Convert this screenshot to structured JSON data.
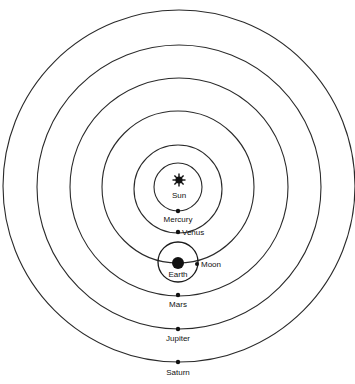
{
  "diagram": {
    "type": "geocentric-tychonic-style orbit diagram",
    "center": {
      "x": 178,
      "y": 187
    },
    "colors": {
      "background": "#ffffff",
      "ink": "#111111"
    },
    "sun": {
      "label": "Sun",
      "icon": "sun-icon",
      "x": 179,
      "y": 185
    },
    "orbits": [
      {
        "name": "Mercury",
        "label": "Mercury",
        "r": 24
      },
      {
        "name": "Venus",
        "label": "Venus",
        "r": 45
      },
      {
        "name": "Earth",
        "label": "Earth",
        "r": 76
      },
      {
        "name": "Mars",
        "label": "Mars",
        "r": 108
      },
      {
        "name": "Jupiter",
        "label": "Jupiter",
        "r": 142
      },
      {
        "name": "Saturn",
        "label": "Saturn",
        "r": 175
      }
    ],
    "labels": {
      "sun": "Sun",
      "mercury": "Mercury",
      "venus": "Venus",
      "earth": "Earth",
      "moon": "Moon",
      "mars": "Mars",
      "jupiter": "Jupiter",
      "saturn": "Saturn"
    },
    "earth_system": {
      "earth_x": 178,
      "earth_y": 263,
      "moon_orbit_r": 20,
      "moon_x": 197,
      "moon_y": 264
    }
  }
}
